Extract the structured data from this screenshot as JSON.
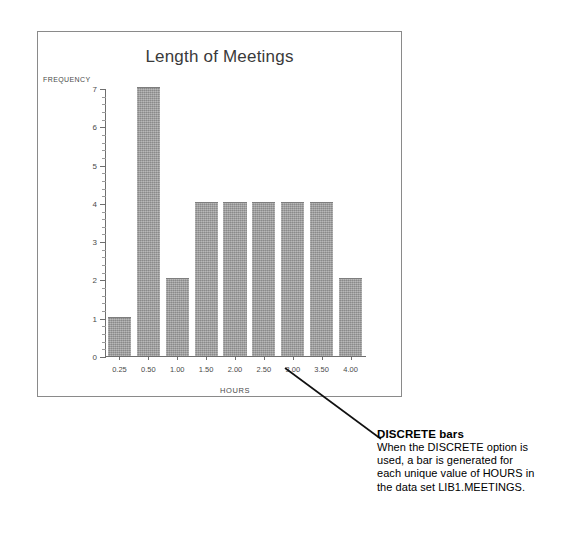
{
  "chart_data": {
    "type": "bar",
    "title": "Length of Meetings",
    "xlabel": "HOURS",
    "ylabel": "FREQUENCY",
    "categories": [
      "0.25",
      "0.50",
      "1.00",
      "1.50",
      "2.00",
      "2.50",
      "3.00",
      "3.50",
      "4.00"
    ],
    "values": [
      1,
      7,
      2,
      4,
      4,
      4,
      4,
      4,
      2
    ],
    "ylim": [
      0,
      7
    ],
    "y_ticks": [
      "0",
      "1",
      "2",
      "3",
      "4",
      "5",
      "6",
      "7"
    ],
    "y_minor_ticks_per_interval": 5,
    "grid": false,
    "legend": null,
    "bar_color": "#9d9d9d",
    "axis_color": "#6f6f6f"
  },
  "callout": {
    "heading": "DISCRETE bars",
    "body_lines": [
      "When the DISCRETE option is",
      "used, a bar is generated for",
      "each unique value of HOURS in",
      "the data set LIB1.MEETINGS."
    ]
  }
}
